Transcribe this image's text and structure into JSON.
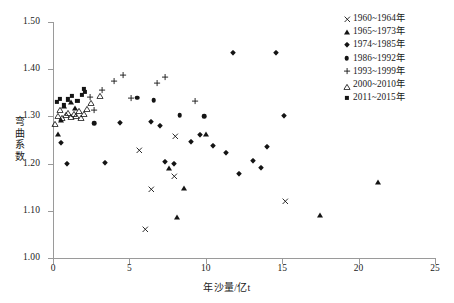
{
  "chart_data": {
    "type": "scatter",
    "title": "",
    "xlabel": "年沙量/亿t",
    "ylabel": "弯曲系数",
    "xlim": [
      0,
      25
    ],
    "ylim": [
      1.0,
      1.5
    ],
    "xticks": [
      "0",
      "5",
      "10",
      "15",
      "20",
      "25"
    ],
    "yticks": [
      "1.00",
      "1.10",
      "1.20",
      "1.30",
      "1.40",
      "1.50"
    ],
    "grid": false,
    "legend_position": "top-right",
    "series": [
      {
        "name": "1960~1964年",
        "marker": "cross",
        "points": [
          [
            6.0,
            1.061
          ],
          [
            6.4,
            1.146
          ],
          [
            5.6,
            1.228
          ],
          [
            7.9,
            1.174
          ],
          [
            8.0,
            1.258
          ],
          [
            15.2,
            1.121
          ]
        ]
      },
      {
        "name": "1965~1973年",
        "marker": "triangle-filled",
        "points": [
          [
            0.35,
            1.262
          ],
          [
            0.55,
            1.292
          ],
          [
            0.75,
            1.322
          ],
          [
            1.15,
            1.331
          ],
          [
            1.45,
            1.318
          ],
          [
            7.6,
            1.19
          ],
          [
            8.6,
            1.149
          ],
          [
            8.1,
            1.086
          ],
          [
            10.0,
            1.263
          ],
          [
            17.5,
            1.091
          ],
          [
            21.3,
            1.16
          ]
        ]
      },
      {
        "name": "1974~1985年",
        "marker": "diamond",
        "points": [
          [
            0.5,
            1.243
          ],
          [
            0.9,
            1.2
          ],
          [
            3.4,
            1.202
          ],
          [
            4.4,
            1.287
          ],
          [
            6.4,
            1.288
          ],
          [
            7.0,
            1.28
          ],
          [
            7.3,
            1.203
          ],
          [
            7.9,
            1.2
          ],
          [
            9.0,
            1.245
          ],
          [
            9.6,
            1.26
          ],
          [
            10.5,
            1.238
          ],
          [
            11.3,
            1.222
          ],
          [
            11.8,
            1.434
          ],
          [
            12.2,
            1.178
          ],
          [
            13.1,
            1.205
          ],
          [
            13.6,
            1.191
          ],
          [
            14.6,
            1.434
          ],
          [
            15.1,
            1.301
          ],
          [
            14.0,
            1.236
          ]
        ]
      },
      {
        "name": "1986~1992年",
        "marker": "circle",
        "points": [
          [
            2.7,
            1.285
          ],
          [
            5.5,
            1.34
          ],
          [
            6.6,
            1.334
          ],
          [
            8.3,
            1.303
          ],
          [
            9.9,
            1.301
          ]
        ]
      },
      {
        "name": "1993~1999年",
        "marker": "plus",
        "points": [
          [
            2.4,
            1.342
          ],
          [
            2.7,
            1.313
          ],
          [
            3.2,
            1.355
          ],
          [
            4.6,
            1.388
          ],
          [
            5.1,
            1.34
          ],
          [
            6.8,
            1.371
          ],
          [
            7.3,
            1.383
          ],
          [
            9.3,
            1.333
          ],
          [
            4.0,
            1.376
          ]
        ]
      },
      {
        "name": "2000~2010年",
        "marker": "triangle-open",
        "points": [
          [
            0.15,
            1.288
          ],
          [
            0.3,
            1.306
          ],
          [
            0.45,
            1.318
          ],
          [
            0.6,
            1.3
          ],
          [
            0.85,
            1.308
          ],
          [
            1.0,
            1.312
          ],
          [
            1.2,
            1.302
          ],
          [
            1.35,
            1.31
          ],
          [
            1.5,
            1.305
          ],
          [
            1.7,
            1.316
          ],
          [
            1.85,
            1.3
          ],
          [
            2.05,
            1.309
          ],
          [
            2.25,
            1.32
          ],
          [
            2.5,
            1.332
          ],
          [
            3.1,
            1.347
          ]
        ]
      },
      {
        "name": "2011~2015年",
        "marker": "square",
        "points": [
          [
            0.25,
            1.33
          ],
          [
            0.45,
            1.337
          ],
          [
            0.7,
            1.325
          ],
          [
            1.0,
            1.336
          ],
          [
            1.25,
            1.344
          ],
          [
            1.6,
            1.332
          ],
          [
            1.9,
            1.346
          ],
          [
            2.0,
            1.358
          ],
          [
            2.1,
            1.352
          ]
        ]
      }
    ]
  },
  "legend": {
    "items": [
      {
        "label": "1960~1964年",
        "marker": "cross"
      },
      {
        "label": "1965~1973年",
        "marker": "triangle-filled"
      },
      {
        "label": "1974~1985年",
        "marker": "diamond"
      },
      {
        "label": "1986~1992年",
        "marker": "circle"
      },
      {
        "label": "1993~1999年",
        "marker": "plus"
      },
      {
        "label": "2000~2010年",
        "marker": "triangle-open"
      },
      {
        "label": "2011~2015年",
        "marker": "square"
      }
    ]
  },
  "colors": {
    "marker": "#141414",
    "axis": "#9a9a9a",
    "text": "#1a1a1a",
    "background": "#ffffff"
  }
}
